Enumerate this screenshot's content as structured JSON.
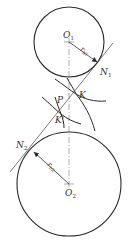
{
  "diagram": {
    "title": "",
    "colors": {
      "stroke": "#2a2a2a",
      "thin": "#555555",
      "text": "#333333",
      "background": "#ffffff"
    },
    "circles": [
      {
        "name": "base-circle-1",
        "cx": 69,
        "cy": 42,
        "r": 35
      },
      {
        "name": "base-circle-2",
        "cx": 69,
        "cy": 184,
        "r": 52
      }
    ],
    "labels": {
      "O1": {
        "main": "O",
        "sub": "1"
      },
      "O2": {
        "main": "O",
        "sub": "2"
      },
      "N1": {
        "main": "N",
        "sub": "1"
      },
      "N2": {
        "main": "N",
        "sub": "2"
      },
      "P": {
        "main": "P"
      },
      "K": {
        "main": "K"
      },
      "Kprime": {
        "main": "K'"
      },
      "rb1": {
        "main": "r",
        "sub": "b1"
      },
      "rb2": {
        "main": "r",
        "sub": "b2"
      }
    },
    "points": {
      "O1": [
        69,
        42
      ],
      "O2": [
        69,
        184
      ],
      "N1": [
        98,
        63
      ],
      "N2": [
        33,
        151
      ],
      "P": [
        66,
        107
      ],
      "K": [
        76,
        94
      ],
      "Kprime": [
        61,
        114
      ]
    },
    "line_of_action": {
      "from": [
        10,
        172
      ],
      "to": [
        113,
        43
      ]
    },
    "center_line": {
      "from": [
        69,
        42
      ],
      "to": [
        69,
        184
      ],
      "style": "dash-dot"
    }
  }
}
